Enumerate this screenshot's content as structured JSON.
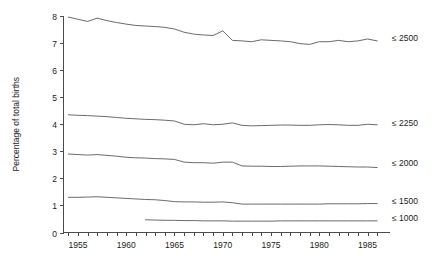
{
  "chart_data": {
    "type": "line",
    "title": "",
    "subtitle": "",
    "xlabel": "",
    "ylabel": "Percentage of total births",
    "xlim": [
      1953.5,
      1986.5
    ],
    "ylim": [
      0,
      8
    ],
    "grid": false,
    "legend_position": "right-inline",
    "x_tick_labels": [
      "1955",
      "1960",
      "1965",
      "1970",
      "1975",
      "1980",
      "1985"
    ],
    "x_tick_values": [
      1955,
      1960,
      1965,
      1970,
      1975,
      1980,
      1985
    ],
    "x_minor_ticks": [
      1954,
      1955,
      1956,
      1957,
      1958,
      1959,
      1960,
      1961,
      1962,
      1963,
      1964,
      1965,
      1966,
      1967,
      1968,
      1969,
      1970,
      1971,
      1972,
      1973,
      1974,
      1975,
      1976,
      1977,
      1978,
      1979,
      1980,
      1981,
      1982,
      1983,
      1984,
      1985,
      1986
    ],
    "y_tick_labels": [
      "0",
      "1",
      "2",
      "3",
      "4",
      "5",
      "6",
      "7",
      "8"
    ],
    "y_tick_values": [
      0,
      1,
      2,
      3,
      4,
      5,
      6,
      7,
      8
    ],
    "series": [
      {
        "name": "≤ 2500",
        "label": "≤ 2500",
        "x": [
          1954,
          1955,
          1956,
          1957,
          1958,
          1959,
          1960,
          1961,
          1962,
          1963,
          1964,
          1965,
          1966,
          1967,
          1968,
          1969,
          1970,
          1971,
          1972,
          1973,
          1974,
          1975,
          1976,
          1977,
          1978,
          1979,
          1980,
          1981,
          1982,
          1983,
          1984,
          1985,
          1986
        ],
        "values": [
          7.96,
          7.88,
          7.8,
          7.92,
          7.83,
          7.76,
          7.7,
          7.65,
          7.63,
          7.61,
          7.58,
          7.52,
          7.4,
          7.33,
          7.3,
          7.28,
          7.45,
          7.1,
          7.08,
          7.05,
          7.12,
          7.1,
          7.08,
          7.05,
          6.98,
          6.95,
          7.05,
          7.05,
          7.1,
          7.05,
          7.08,
          7.15,
          7.08
        ]
      },
      {
        "name": "≤ 2250",
        "label": "≤ 2250",
        "x": [
          1954,
          1955,
          1956,
          1957,
          1958,
          1959,
          1960,
          1961,
          1962,
          1963,
          1964,
          1965,
          1966,
          1967,
          1968,
          1969,
          1970,
          1971,
          1972,
          1973,
          1974,
          1975,
          1976,
          1977,
          1978,
          1979,
          1980,
          1981,
          1982,
          1983,
          1984,
          1985,
          1986
        ],
        "values": [
          4.35,
          4.33,
          4.32,
          4.3,
          4.28,
          4.25,
          4.22,
          4.2,
          4.18,
          4.17,
          4.15,
          4.12,
          4.0,
          3.98,
          4.02,
          3.98,
          4.0,
          4.05,
          3.96,
          3.94,
          3.95,
          3.96,
          3.97,
          3.97,
          3.96,
          3.96,
          3.98,
          3.99,
          3.98,
          3.96,
          3.96,
          4.0,
          3.98
        ]
      },
      {
        "name": "≤ 2000",
        "label": "≤ 2000",
        "x": [
          1954,
          1955,
          1956,
          1957,
          1958,
          1959,
          1960,
          1961,
          1962,
          1963,
          1964,
          1965,
          1966,
          1967,
          1968,
          1969,
          1970,
          1971,
          1972,
          1973,
          1974,
          1975,
          1976,
          1977,
          1978,
          1979,
          1980,
          1981,
          1982,
          1983,
          1984,
          1985,
          1986
        ],
        "values": [
          2.9,
          2.88,
          2.86,
          2.88,
          2.85,
          2.82,
          2.78,
          2.76,
          2.75,
          2.73,
          2.72,
          2.7,
          2.6,
          2.58,
          2.58,
          2.56,
          2.6,
          2.6,
          2.46,
          2.45,
          2.45,
          2.44,
          2.44,
          2.45,
          2.46,
          2.46,
          2.46,
          2.45,
          2.44,
          2.43,
          2.42,
          2.42,
          2.4
        ]
      },
      {
        "name": "≤ 1500",
        "label": "≤ 1500",
        "x": [
          1954,
          1955,
          1956,
          1957,
          1958,
          1959,
          1960,
          1961,
          1962,
          1963,
          1964,
          1965,
          1966,
          1967,
          1968,
          1969,
          1970,
          1971,
          1972,
          1973,
          1974,
          1975,
          1976,
          1977,
          1978,
          1979,
          1980,
          1981,
          1982,
          1983,
          1984,
          1985,
          1986
        ],
        "values": [
          1.3,
          1.3,
          1.31,
          1.32,
          1.3,
          1.28,
          1.26,
          1.24,
          1.22,
          1.21,
          1.18,
          1.14,
          1.13,
          1.13,
          1.12,
          1.12,
          1.13,
          1.1,
          1.05,
          1.05,
          1.05,
          1.05,
          1.05,
          1.05,
          1.05,
          1.05,
          1.05,
          1.06,
          1.06,
          1.06,
          1.06,
          1.07,
          1.07
        ]
      },
      {
        "name": "≤ 1000",
        "label": "≤ 1000",
        "x": [
          1962,
          1963,
          1964,
          1965,
          1966,
          1967,
          1968,
          1969,
          1970,
          1971,
          1972,
          1973,
          1974,
          1975,
          1976,
          1977,
          1978,
          1979,
          1980,
          1981,
          1982,
          1983,
          1984,
          1985,
          1986
        ],
        "values": [
          0.47,
          0.46,
          0.45,
          0.45,
          0.44,
          0.44,
          0.43,
          0.43,
          0.43,
          0.42,
          0.42,
          0.42,
          0.42,
          0.42,
          0.43,
          0.43,
          0.43,
          0.43,
          0.43,
          0.43,
          0.43,
          0.43,
          0.43,
          0.43,
          0.43
        ]
      }
    ],
    "series_label_y": [
      7.2,
      4.05,
      2.55,
      1.15,
      0.52
    ]
  }
}
